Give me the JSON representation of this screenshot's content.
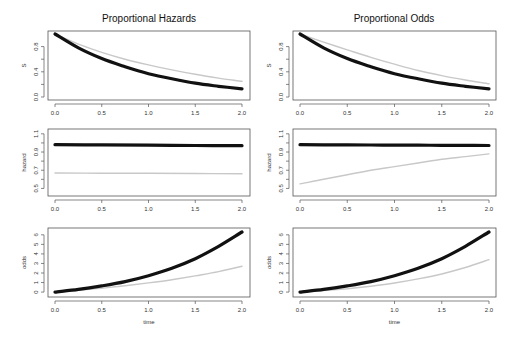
{
  "columns": [
    {
      "title": "Proportional Hazards"
    },
    {
      "title": "Proportional Odds"
    }
  ],
  "chart_data": [
    {
      "type": "line",
      "title": "Proportional Hazards",
      "panel": "S",
      "xlabel": "",
      "ylabel": "S",
      "xlim": [
        0,
        2
      ],
      "ylim": [
        0,
        1
      ],
      "xticks": [
        "0.0",
        "0.5",
        "1.0",
        "1.5",
        "2.0"
      ],
      "yticks": [
        "0.0",
        "0.4",
        "0.8"
      ],
      "x": [
        0,
        0.25,
        0.5,
        0.75,
        1.0,
        1.25,
        1.5,
        1.75,
        2.0
      ],
      "series": [
        {
          "name": "black",
          "values": [
            1.0,
            0.78,
            0.61,
            0.48,
            0.37,
            0.29,
            0.22,
            0.17,
            0.13
          ]
        },
        {
          "name": "gray",
          "values": [
            1.0,
            0.84,
            0.71,
            0.6,
            0.51,
            0.43,
            0.36,
            0.3,
            0.25
          ]
        }
      ]
    },
    {
      "type": "line",
      "title": "Proportional Odds",
      "panel": "S",
      "xlabel": "",
      "ylabel": "S",
      "xlim": [
        0,
        2
      ],
      "ylim": [
        0,
        1
      ],
      "xticks": [
        "0.0",
        "0.5",
        "1.0",
        "1.5",
        "2.0"
      ],
      "yticks": [
        "0.0",
        "0.4",
        "0.8"
      ],
      "x": [
        0,
        0.25,
        0.5,
        0.75,
        1.0,
        1.25,
        1.5,
        1.75,
        2.0
      ],
      "series": [
        {
          "name": "black",
          "values": [
            1.0,
            0.78,
            0.61,
            0.48,
            0.37,
            0.29,
            0.22,
            0.17,
            0.13
          ]
        },
        {
          "name": "gray",
          "values": [
            1.0,
            0.87,
            0.75,
            0.63,
            0.52,
            0.42,
            0.34,
            0.27,
            0.21
          ]
        }
      ]
    },
    {
      "type": "line",
      "title": "",
      "panel": "hazard",
      "xlabel": "",
      "ylabel": "hazard",
      "xlim": [
        0,
        2
      ],
      "ylim": [
        0.45,
        1.12
      ],
      "xticks": [
        "0.0",
        "0.5",
        "1.0",
        "1.5",
        "2.0"
      ],
      "yticks": [
        "0.5",
        "0.7",
        "0.9",
        "1.1"
      ],
      "x": [
        0,
        0.5,
        1.0,
        1.5,
        2.0
      ],
      "series": [
        {
          "name": "black",
          "values": [
            0.98,
            0.978,
            0.975,
            0.972,
            0.97
          ]
        },
        {
          "name": "gray",
          "values": [
            0.67,
            0.668,
            0.666,
            0.664,
            0.662
          ]
        }
      ]
    },
    {
      "type": "line",
      "title": "",
      "panel": "hazard",
      "xlabel": "",
      "ylabel": "hazard",
      "xlim": [
        0,
        2
      ],
      "ylim": [
        0.45,
        1.12
      ],
      "xticks": [
        "0.0",
        "0.5",
        "1.0",
        "1.5",
        "2.0"
      ],
      "yticks": [
        "0.5",
        "0.7",
        "0.9",
        "1.1"
      ],
      "x": [
        0,
        0.25,
        0.5,
        0.75,
        1.0,
        1.25,
        1.5,
        1.75,
        2.0
      ],
      "series": [
        {
          "name": "black",
          "values": [
            0.98,
            0.979,
            0.978,
            0.977,
            0.976,
            0.975,
            0.974,
            0.973,
            0.972
          ]
        },
        {
          "name": "gray",
          "values": [
            0.55,
            0.6,
            0.65,
            0.7,
            0.74,
            0.78,
            0.82,
            0.85,
            0.88
          ]
        }
      ]
    },
    {
      "type": "line",
      "title": "",
      "panel": "odds",
      "xlabel": "time",
      "ylabel": "odds",
      "xlim": [
        0,
        2
      ],
      "ylim": [
        -0.2,
        6.4
      ],
      "xticks": [
        "0.0",
        "0.5",
        "1.0",
        "1.5",
        "2.0"
      ],
      "yticks": [
        "0",
        "1",
        "2",
        "3",
        "4",
        "5",
        "6"
      ],
      "x": [
        0,
        0.25,
        0.5,
        0.75,
        1.0,
        1.25,
        1.5,
        1.75,
        2.0
      ],
      "series": [
        {
          "name": "black",
          "values": [
            0.0,
            0.28,
            0.65,
            1.1,
            1.72,
            2.5,
            3.5,
            4.8,
            6.3
          ]
        },
        {
          "name": "gray",
          "values": [
            0.0,
            0.19,
            0.41,
            0.66,
            0.96,
            1.3,
            1.7,
            2.15,
            2.7
          ]
        }
      ]
    },
    {
      "type": "line",
      "title": "",
      "panel": "odds",
      "xlabel": "time",
      "ylabel": "odds",
      "xlim": [
        0,
        2
      ],
      "ylim": [
        -0.2,
        6.4
      ],
      "xticks": [
        "0.0",
        "0.5",
        "1.0",
        "1.5",
        "2.0"
      ],
      "yticks": [
        "0",
        "1",
        "2",
        "3",
        "4",
        "5",
        "6"
      ],
      "x": [
        0,
        0.25,
        0.5,
        0.75,
        1.0,
        1.25,
        1.5,
        1.75,
        2.0
      ],
      "series": [
        {
          "name": "black",
          "values": [
            0.0,
            0.28,
            0.65,
            1.1,
            1.72,
            2.5,
            3.5,
            4.8,
            6.3
          ]
        },
        {
          "name": "gray",
          "values": [
            0.0,
            0.16,
            0.36,
            0.62,
            0.95,
            1.38,
            1.9,
            2.58,
            3.4
          ]
        }
      ]
    }
  ],
  "layout": {
    "panels": [
      {
        "left": 48,
        "right": 250,
        "top": 31,
        "bottom": 100,
        "x0": 55,
        "x1": 242
      },
      {
        "left": 293,
        "right": 496,
        "top": 31,
        "bottom": 100,
        "x0": 300,
        "x1": 489
      },
      {
        "left": 48,
        "right": 250,
        "top": 129,
        "bottom": 196,
        "x0": 55,
        "x1": 242
      },
      {
        "left": 293,
        "right": 496,
        "top": 129,
        "bottom": 196,
        "x0": 300,
        "x1": 489
      },
      {
        "left": 48,
        "right": 250,
        "top": 228,
        "bottom": 297,
        "x0": 55,
        "x1": 242
      },
      {
        "left": 293,
        "right": 496,
        "top": 228,
        "bottom": 297,
        "x0": 300,
        "x1": 489
      }
    ],
    "colors": {
      "black": "#111111",
      "gray": "#c8c8c8"
    }
  }
}
